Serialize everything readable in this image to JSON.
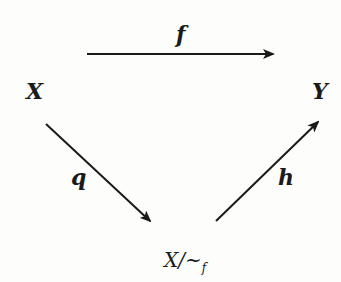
{
  "diagram": {
    "type": "commutative-triangle",
    "nodes": {
      "X": "X",
      "Y": "Y",
      "quotient_base": "X/~",
      "quotient_sub": "f"
    },
    "arrows": [
      {
        "from": "X",
        "to": "Y",
        "label": "f"
      },
      {
        "from": "X",
        "to": "X/~f",
        "label": "q"
      },
      {
        "from": "X/~f",
        "to": "Y",
        "label": "h"
      }
    ],
    "colors": {
      "ink": "#1a1a1a",
      "background": "#fdfdfb"
    }
  }
}
